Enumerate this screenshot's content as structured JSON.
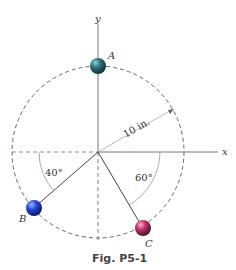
{
  "figure": {
    "caption": "Fig. P5-1",
    "axes": {
      "x_label": "x",
      "y_label": "y"
    },
    "radius_label": "10 in.",
    "masses": [
      {
        "label": "A",
        "color": "#1f5f66",
        "position": "on +y axis"
      },
      {
        "label": "B",
        "color": "#1a3fbf",
        "angle_label": "40°",
        "angle_ref": "below -x axis"
      },
      {
        "label": "C",
        "color": "#b0305a",
        "angle_label": "60°",
        "angle_ref": "below +x axis"
      }
    ]
  }
}
